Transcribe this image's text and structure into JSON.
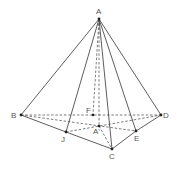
{
  "diagram": {
    "type": "pyramid",
    "colors": {
      "line": "#333333",
      "label": "#555555",
      "background": "#ffffff"
    },
    "points": {
      "A": {
        "label": "A",
        "x": 99,
        "y": 19
      },
      "B": {
        "label": "B",
        "x": 21,
        "y": 115
      },
      "C": {
        "label": "C",
        "x": 112,
        "y": 149
      },
      "D": {
        "label": "D",
        "x": 161,
        "y": 115
      },
      "E": {
        "label": "E",
        "x": 136,
        "y": 131
      },
      "J": {
        "label": "J",
        "x": 66,
        "y": 132
      },
      "F": {
        "label": "F",
        "x": 93,
        "y": 115
      },
      "A1": {
        "label": "A'",
        "x": 99,
        "y": 126
      }
    },
    "solid_edges": [
      [
        "A",
        "B"
      ],
      [
        "A",
        "J"
      ],
      [
        "A",
        "C"
      ],
      [
        "A",
        "E"
      ],
      [
        "A",
        "D"
      ],
      [
        "B",
        "J"
      ],
      [
        "J",
        "C"
      ],
      [
        "C",
        "E"
      ],
      [
        "E",
        "D"
      ]
    ],
    "dashed_edges": [
      [
        "A",
        "F"
      ],
      [
        "A",
        "A1"
      ],
      [
        "B",
        "D"
      ],
      [
        "B",
        "E"
      ],
      [
        "J",
        "D"
      ],
      [
        "A1",
        "C"
      ]
    ]
  }
}
